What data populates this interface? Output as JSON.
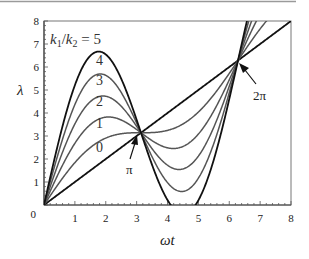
{
  "chart_data": {
    "type": "line",
    "title": "",
    "xlabel": "ωt",
    "ylabel": "λ",
    "xlim": [
      0,
      8
    ],
    "ylim": [
      0,
      8
    ],
    "x_ticks": [
      "0",
      "1",
      "2",
      "3",
      "4",
      "5",
      "6",
      "7",
      "8"
    ],
    "y_ticks": [
      "0",
      "1",
      "2",
      "3",
      "4",
      "5",
      "6",
      "7",
      "8"
    ],
    "grid": false,
    "legend": "inline curve labels",
    "parameter_label": "k1/k2 = 5",
    "formula": "λ = ωt + (k1/k2)·sin(ωt)",
    "series": [
      {
        "name": "0",
        "ratio": 0,
        "color": "#111111",
        "label_pos": [
          1.8,
          2.3
        ]
      },
      {
        "name": "1",
        "ratio": 1,
        "color": "#555555",
        "label_pos": [
          1.8,
          3.35
        ]
      },
      {
        "name": "2",
        "ratio": 2,
        "color": "#555555",
        "label_pos": [
          1.8,
          4.3
        ]
      },
      {
        "name": "3",
        "ratio": 3,
        "color": "#555555",
        "label_pos": [
          1.8,
          5.2
        ]
      },
      {
        "name": "4",
        "ratio": 4,
        "color": "#555555",
        "label_pos": [
          1.8,
          6.1
        ]
      },
      {
        "name": "5",
        "ratio": 5,
        "color": "#111111",
        "label_pos": null
      }
    ],
    "sample_points": {
      "x": [
        0,
        1,
        1.77,
        2,
        3,
        3.1416,
        4,
        4.5,
        5,
        6,
        6.2832,
        7,
        8
      ],
      "ratio_5": [
        0,
        5.21,
        6.67,
        6.55,
        3.71,
        3.14,
        0.22,
        -0.39,
        0.21,
        4.6,
        6.28,
        10.28,
        12.95
      ],
      "ratio_1": [
        0,
        1.84,
        2.75,
        2.91,
        3.14,
        3.14,
        3.24,
        3.52,
        4.04,
        5.72,
        6.28,
        7.66,
        8.99
      ]
    },
    "annotations": [
      {
        "text": "π",
        "x": 3.1416,
        "y": 3.1416,
        "label_at": [
          2.78,
          1.45
        ]
      },
      {
        "text": "2π",
        "x": 6.2832,
        "y": 6.2832,
        "label_at": [
          7.0,
          4.8
        ]
      }
    ]
  },
  "labels": {
    "ratio_text_k1": "k",
    "ratio_sub1": "1",
    "ratio_slash": "/",
    "ratio_text_k2": "k",
    "ratio_sub2": "2",
    "ratio_eq": " = 5",
    "pi": "π",
    "two_pi": "2π",
    "xlabel": "ωt",
    "ylabel": "λ"
  }
}
